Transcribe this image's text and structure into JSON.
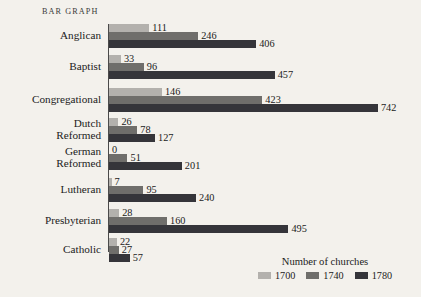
{
  "chart_title": "BAR GRAPH",
  "legend": {
    "title": "Number of churches",
    "entries": [
      {
        "label": "1700",
        "color": "#b3b1ad"
      },
      {
        "label": "1740",
        "color": "#6f6e6b"
      },
      {
        "label": "1780",
        "color": "#35353a"
      }
    ]
  },
  "chart_data": {
    "type": "bar",
    "orientation": "horizontal",
    "title": "BAR GRAPH",
    "xlabel": "Number of churches",
    "ylabel": "",
    "grid": false,
    "legend_position": "bottom-right",
    "xlim": [
      0,
      742
    ],
    "categories": [
      "Anglican",
      "Baptist",
      "Congregational",
      "Dutch\nReformed",
      "German\nReformed",
      "Lutheran",
      "Presbyterian",
      "Catholic"
    ],
    "series": [
      {
        "name": "1700",
        "color": "#b3b1ad",
        "values": [
          111,
          33,
          146,
          26,
          0,
          7,
          28,
          22
        ]
      },
      {
        "name": "1740",
        "color": "#6f6e6b",
        "values": [
          246,
          96,
          423,
          78,
          51,
          95,
          160,
          27
        ]
      },
      {
        "name": "1780",
        "color": "#35353a",
        "values": [
          406,
          457,
          742,
          127,
          201,
          240,
          495,
          57
        ]
      }
    ],
    "value_labels": [
      {
        "category": "Anglican",
        "values": [
          "111",
          "246",
          "406"
        ]
      },
      {
        "category": "Baptist",
        "values": [
          "33",
          "96",
          "457"
        ]
      },
      {
        "category": "Congregational",
        "values": [
          "146",
          "423",
          "742"
        ]
      },
      {
        "category": "Dutch Reformed",
        "values": [
          "26",
          "78",
          "127"
        ]
      },
      {
        "category": "German Reformed",
        "values": [
          "0",
          "51",
          "201"
        ]
      },
      {
        "category": "Lutheran",
        "values": [
          "7",
          "95",
          "240"
        ]
      },
      {
        "category": "Presbyterian",
        "values": [
          "28",
          "160",
          "495"
        ]
      },
      {
        "category": "Catholic",
        "values": [
          "22",
          "27",
          "57"
        ]
      }
    ]
  }
}
